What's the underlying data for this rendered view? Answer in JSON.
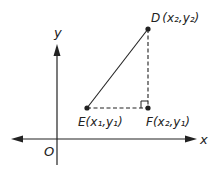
{
  "diagram": {
    "type": "coordinate-geometry",
    "axes": {
      "x_label": "x",
      "y_label": "y",
      "origin_label": "O"
    },
    "points": {
      "D": {
        "name": "D",
        "coords": "(x₂,y₂)",
        "x": 148,
        "y": 29
      },
      "E": {
        "name": "E",
        "coords": "(x₁,y₁)",
        "x": 87,
        "y": 108
      },
      "F": {
        "name": "F",
        "coords": "(x₂,y₁)",
        "x": 148,
        "y": 108
      }
    },
    "segments": [
      {
        "from": "E",
        "to": "D",
        "style": "solid"
      },
      {
        "from": "E",
        "to": "F",
        "style": "dashed"
      },
      {
        "from": "F",
        "to": "D",
        "style": "dashed"
      }
    ],
    "right_angle_at": "F",
    "colors": {
      "line": "#222222",
      "background": "#ffffff"
    }
  }
}
